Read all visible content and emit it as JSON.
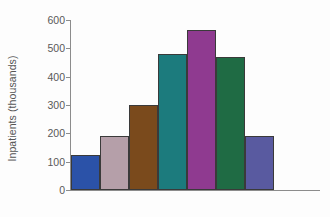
{
  "chart_data": {
    "type": "bar",
    "title": "",
    "subtitle": "",
    "xlabel": "",
    "ylabel": "Inpatients (thousands)",
    "categories": [
      "1",
      "2",
      "3",
      "4",
      "5",
      "6",
      "7"
    ],
    "values": [
      125,
      190,
      300,
      480,
      565,
      470,
      190
    ],
    "bar_colors": [
      "#2b52a8",
      "#b59fa9",
      "#7a4a1c",
      "#1c7b7d",
      "#8f3a90",
      "#1f6b44",
      "#595aa0"
    ],
    "bar_edge_color": "#3a3a3a",
    "ylim": [
      0,
      600
    ],
    "yticks": [
      0,
      100,
      200,
      300,
      400,
      500,
      600
    ],
    "ytick_labels": [
      "0",
      "100",
      "200",
      "300",
      "400",
      "500",
      "600"
    ],
    "xticks": [],
    "xtick_labels": [],
    "grid": false,
    "legend": false,
    "legend_position": "none",
    "axis_color": "#8c8c8c",
    "tick_label_color": "#595959",
    "background_color": "#fdfdfd"
  }
}
